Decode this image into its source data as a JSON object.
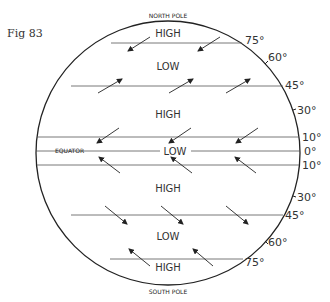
{
  "figure": {
    "label": "Fig 83",
    "north_pole": "NORTH POLE",
    "south_pole": "SOUTH POLE",
    "equator": "EQUATOR"
  },
  "zones": [
    {
      "label": "HIGH",
      "position": "north polar"
    },
    {
      "label": "LOW",
      "position": "north 45-75"
    },
    {
      "label": "HIGH",
      "position": "north 10-45"
    },
    {
      "label": "LOW",
      "position": "equatorial"
    },
    {
      "label": "HIGH",
      "position": "south 10-45"
    },
    {
      "label": "LOW",
      "position": "south 45-75"
    },
    {
      "label": "HIGH",
      "position": "south polar"
    }
  ],
  "latitudes": {
    "n75": "75°",
    "n60": "60°",
    "n45": "45°",
    "n30": "30°",
    "n10": "10°",
    "eq": "0°",
    "s10": "10°",
    "s30": "30°",
    "s45": "45°",
    "s60": "60°",
    "s75": "75°"
  },
  "wind_directions": {
    "polar_north": "arrows pointing south-west",
    "westerlies_north": "arrows pointing north-east",
    "trades_north": "arrows pointing south-west",
    "trades_south": "arrows pointing north-west",
    "westerlies_south": "arrows pointing south-east",
    "polar_south": "arrows pointing north-west"
  }
}
